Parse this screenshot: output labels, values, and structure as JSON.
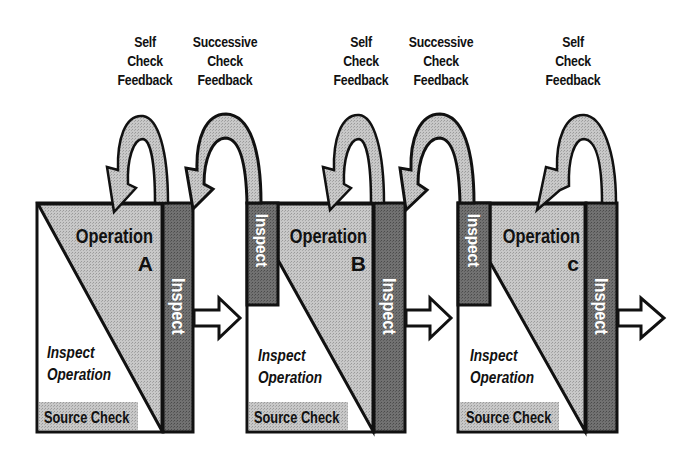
{
  "diagram": {
    "title": "",
    "colors": {
      "operation_fill": "#bdbdbd",
      "inspect_fill": "#6b6b6b",
      "source_check_fill": "#c4c4c4",
      "feedback_arrow_fill": "#c2c2c2",
      "outline": "#111111",
      "inspect_text": "#ffffff",
      "background": "#ffffff"
    },
    "stations": [
      {
        "id": "A",
        "operation_label": "Operation",
        "operation_letter": "A",
        "inspect_operation_line1": "Inspect",
        "inspect_operation_line2": "Operation",
        "source_check_label": "Source Check",
        "self_inspect_label": "Inspect",
        "successive_inspect_label": null,
        "self_check_feedback": [
          "Self",
          "Check",
          "Feedback"
        ],
        "successive_check_feedback": [
          "Successive",
          "Check",
          "Feedback"
        ]
      },
      {
        "id": "B",
        "operation_label": "Operation",
        "operation_letter": "B",
        "inspect_operation_line1": "Inspect",
        "inspect_operation_line2": "Operation",
        "source_check_label": "Source Check",
        "self_inspect_label": "Inspect",
        "successive_inspect_label": "Inspect",
        "self_check_feedback": [
          "Self",
          "Check",
          "Feedback"
        ],
        "successive_check_feedback": [
          "Successive",
          "Check",
          "Feedback"
        ]
      },
      {
        "id": "C",
        "operation_label": "Operation",
        "operation_letter": "c",
        "inspect_operation_line1": "Inspect",
        "inspect_operation_line2": "Operation",
        "source_check_label": "Source Check",
        "self_inspect_label": "Inspect",
        "successive_inspect_label": "Inspect",
        "self_check_feedback": [
          "Self",
          "Check",
          "Feedback"
        ],
        "successive_check_feedback": null
      }
    ]
  }
}
